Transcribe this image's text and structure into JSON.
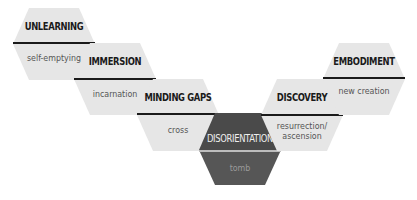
{
  "diagram": {
    "colors": {
      "light_fill": "#e6e6e6",
      "dark_fill_top": "#4a4a4a",
      "dark_fill_bottom": "#565656",
      "divider": "#1a1a1a"
    },
    "stages": [
      {
        "title": "UNLEARNING",
        "subtitle": "self-emptying"
      },
      {
        "title": "IMMERSION",
        "subtitle": "incarnation"
      },
      {
        "title": "MINDING GAPS",
        "subtitle": "cross"
      },
      {
        "title": "DISORIENTATION",
        "subtitle": "tomb"
      },
      {
        "title": "DISCOVERY",
        "subtitle": "resurrection/ ascension"
      },
      {
        "title": "EMBODIMENT",
        "subtitle": "new creation"
      }
    ]
  }
}
